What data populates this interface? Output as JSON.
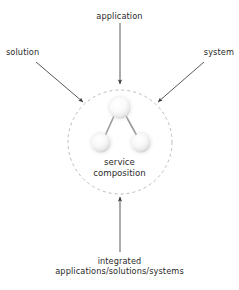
{
  "diagram": {
    "title": "service composition",
    "background_color": "#ffffff",
    "text_color": "#2b2b2b",
    "boundary": {
      "shape": "dashed-circle",
      "stroke_color": "#b4b4b4",
      "dash": "3 3",
      "center_x": 120,
      "center_y": 142,
      "radius": 52
    },
    "center_label": {
      "line1": "service",
      "line2": "composition"
    },
    "nodes": [
      {
        "name": "top-sphere",
        "cx": 120,
        "cy": 108,
        "r": 10.5,
        "fill": "#fdfdfd",
        "edge": "#d8d8d8"
      },
      {
        "name": "bottom-left-sphere",
        "cx": 101,
        "cy": 143,
        "r": 9.5,
        "fill": "#fbfbfb",
        "edge": "#dcdcdc"
      },
      {
        "name": "bottom-right-sphere",
        "cx": 141,
        "cy": 143,
        "r": 9.5,
        "fill": "#fbfbfb",
        "edge": "#dcdcdc"
      }
    ],
    "connectors": [
      {
        "name": "top-to-left",
        "x1": 114,
        "y1": 116,
        "x2": 105,
        "y2": 136,
        "color": "#9a9a9a"
      },
      {
        "name": "top-to-right",
        "x1": 126,
        "y1": 116,
        "x2": 137,
        "y2": 136,
        "color": "#9a9a9a"
      }
    ],
    "arrows": [
      {
        "name": "application-arrow",
        "label": "application",
        "direction": "down",
        "x1": 120,
        "y1": 23,
        "x2": 120,
        "y2": 84,
        "color": "#3a3a3a"
      },
      {
        "name": "solution-arrow",
        "label": "solution",
        "direction": "down-right",
        "x1": 36,
        "y1": 62,
        "x2": 83,
        "y2": 102,
        "color": "#3a3a3a"
      },
      {
        "name": "system-arrow",
        "label": "system",
        "direction": "down-left",
        "x1": 204,
        "y1": 62,
        "x2": 158,
        "y2": 102,
        "color": "#3a3a3a"
      },
      {
        "name": "integrated-arrow",
        "label_line1": "integrated",
        "label_line2": "applications/solutions/systems",
        "direction": "up",
        "x1": 120,
        "y1": 252,
        "x2": 120,
        "y2": 197,
        "color": "#3a3a3a"
      }
    ],
    "labels": {
      "application": "application",
      "solution": "solution",
      "system": "system",
      "integrated_line1": "integrated",
      "integrated_line2": "applications/solutions/systems"
    }
  }
}
